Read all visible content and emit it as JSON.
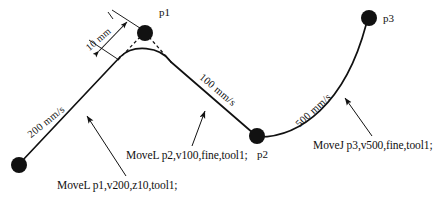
{
  "diagram": {
    "background_color": "#ffffff",
    "stroke_color": "#111111",
    "points": [
      {
        "id": "start",
        "label": "",
        "x": 19,
        "y": 165,
        "radius": 8
      },
      {
        "id": "p1",
        "label": "p1",
        "x": 145,
        "y": 33,
        "radius": 8
      },
      {
        "id": "p2",
        "label": "p2",
        "x": 257,
        "y": 136,
        "radius": 8
      },
      {
        "id": "p3",
        "label": "p3",
        "x": 369,
        "y": 18,
        "radius": 8
      }
    ],
    "point_labels": {
      "p1": "p1",
      "p2": "p2",
      "p3": "p3"
    },
    "speed_labels": [
      {
        "id": "speed-200",
        "text": "200 mm/s",
        "rotation_deg": -39
      },
      {
        "id": "speed-100",
        "text": "100 mm/s",
        "rotation_deg": 40
      },
      {
        "id": "speed-500",
        "text": "500 mm/s",
        "rotation_deg": -43
      }
    ],
    "dimension": {
      "id": "zone-radius-dimension",
      "text": "10 mm",
      "rotation_deg": -40,
      "describes": "z10 corner zone radius at p1"
    },
    "captions": [
      {
        "id": "cap-1",
        "text": "MoveL p1,v200,z10,tool1;"
      },
      {
        "id": "cap-2",
        "text": "MoveL p2,v100,fine,tool1;"
      },
      {
        "id": "cap-3",
        "text": "MoveJ p3,v500,fine,tool1;"
      }
    ]
  }
}
